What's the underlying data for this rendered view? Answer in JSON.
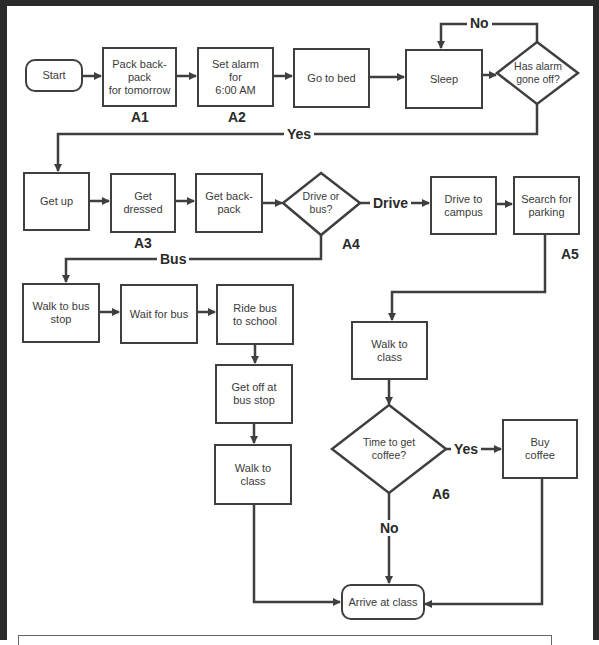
{
  "diagram": {
    "type": "flowchart",
    "colors": {
      "stroke": "#3f3f3f",
      "text": "#3a3a3a",
      "frame": "#2b2b2b",
      "background": "#ffffff"
    },
    "nodes": {
      "start": "Start",
      "pack_backpack": "Pack back-\npack\nfor tomorrow",
      "set_alarm": "Set alarm\nfor\n6:00 AM",
      "go_to_bed": "Go to bed",
      "sleep": "Sleep",
      "alarm_decision": "Has alarm\ngone off?",
      "get_up": "Get up",
      "get_dressed": "Get\ndressed",
      "get_backpack": "Get back-\npack",
      "drive_or_bus": "Drive or\nbus?",
      "drive_to_campus": "Drive to\ncampus",
      "search_parking": "Search for\nparking",
      "walk_to_bus_stop": "Walk to bus\nstop",
      "wait_for_bus": "Wait for bus",
      "ride_bus": "Ride bus\nto school",
      "get_off_bus": "Get off at\nbus  stop",
      "walk_to_class_bus": "Walk to\nclass",
      "walk_to_class_drive": "Walk to\nclass",
      "coffee_decision": "Time to get\ncoffee?",
      "buy_coffee": "Buy\ncoffee",
      "arrive": "Arrive at class"
    },
    "edge_labels": {
      "alarm_no": "No",
      "alarm_yes": "Yes",
      "drive": "Drive",
      "bus": "Bus",
      "coffee_yes": "Yes",
      "coffee_no": "No"
    },
    "step_tags": {
      "a1": "A1",
      "a2": "A2",
      "a3": "A3",
      "a4": "A4",
      "a5": "A5",
      "a6": "A6"
    }
  }
}
